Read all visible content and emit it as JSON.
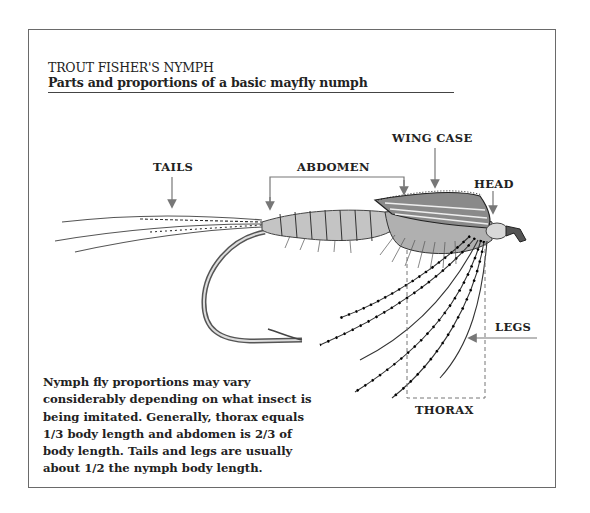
{
  "header": {
    "title": "TROUT FISHER'S NYMPH",
    "subtitle": "Parts and proportions of a basic mayfly numph"
  },
  "labels": {
    "tails": "TAILS",
    "abdomen": "ABDOMEN",
    "wing_case": "WING CASE",
    "head": "HEAD",
    "legs": "LEGS",
    "thorax": "THORAX"
  },
  "description": {
    "lines": [
      "Nymph fly proportions may vary",
      "considerably depending on what insect is",
      "being imitated. Generally, thorax equals",
      "1/3 body length and abdomen is 2/3 of",
      "body length. Tails and legs are usually",
      "about 1/2 the nymph body length."
    ]
  },
  "colors": {
    "ink": "#222222",
    "frame": "#6a6a6a",
    "arrow": "#777777",
    "hook": "#555555"
  }
}
